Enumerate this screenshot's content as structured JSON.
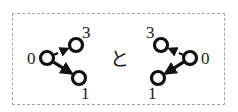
{
  "figure": {
    "type": "two-directed-graph-diagram",
    "conjunction_text": "と",
    "conjunction_meaning": "and",
    "background_color": "#ffffff",
    "ink_color": "#111111",
    "crop_box": {
      "style": "dashed",
      "color": "#a8a8a8",
      "x": 12,
      "y": 13,
      "width": 213,
      "height": 92
    }
  },
  "graphs": [
    {
      "id": "left-graph",
      "name": "left-directed-graph",
      "nodes": [
        {
          "id": "n0",
          "label": "0",
          "cx": 47,
          "cy": 58,
          "r": 6.5,
          "label_x": 27,
          "label_y": 50
        },
        {
          "id": "n3",
          "label": "3",
          "cx": 76,
          "cy": 45,
          "r": 6.5,
          "label_x": 82,
          "label_y": 24
        },
        {
          "id": "n1",
          "label": "1",
          "cx": 79,
          "cy": 78,
          "r": 6.5,
          "label_x": 81,
          "label_y": 85
        }
      ],
      "edges": [
        {
          "id": "e0-3",
          "from": "n0",
          "to": "n3",
          "style": "dashed",
          "width": 2.2,
          "arrow": true
        },
        {
          "id": "e0-1",
          "from": "n0",
          "to": "n1",
          "style": "solid",
          "width": 3.2,
          "arrow": true
        }
      ]
    },
    {
      "id": "right-graph",
      "name": "right-directed-graph",
      "nodes": [
        {
          "id": "n0",
          "label": "0",
          "cx": 190,
          "cy": 58,
          "r": 6.5,
          "label_x": 201,
          "label_y": 50
        },
        {
          "id": "n3",
          "label": "3",
          "cx": 161,
          "cy": 45,
          "r": 6.5,
          "label_x": 146,
          "label_y": 24
        },
        {
          "id": "n1",
          "label": "1",
          "cx": 158,
          "cy": 78,
          "r": 6.5,
          "label_x": 148,
          "label_y": 85
        }
      ],
      "edges": [
        {
          "id": "e0-3",
          "from": "n0",
          "to": "n3",
          "style": "dashed",
          "width": 2.2,
          "arrow": true
        },
        {
          "id": "e0-1",
          "from": "n0",
          "to": "n1",
          "style": "solid",
          "width": 3.2,
          "arrow": true
        }
      ]
    }
  ],
  "conjunction": {
    "text": "と",
    "x": 110,
    "y": 50
  }
}
